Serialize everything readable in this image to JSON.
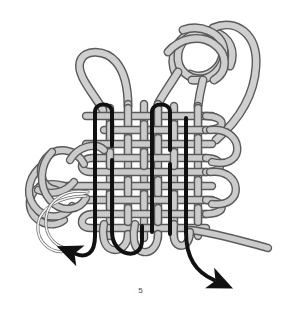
{
  "figure": {
    "caption": "5",
    "type": "knot-weaving-diagram"
  },
  "colors": {
    "background": "#ffffff",
    "cord_gray_fill": "#c9c9c9",
    "cord_gray_fill_light": "#d8d8d8",
    "cord_gray_outline": "#5a5a5a",
    "cord_black": "#111111",
    "caption_text": "#4a4a4a"
  },
  "cords": [
    {
      "name": "gray-cord",
      "color": "#c9c9c9",
      "outline": "#5a5a5a",
      "width": 7,
      "description": "light gray working cord forming top-right knot, side loops and woven grid"
    },
    {
      "name": "black-cord",
      "color": "#111111",
      "width": 4,
      "description": "black cord forming vertical bights through the woven grid, ending in arrows"
    }
  ],
  "markers": [
    {
      "name": "arrow-bottom-left",
      "label": "direction arrow",
      "direction": "left",
      "color": "#111111",
      "x": 74,
      "y": 252
    },
    {
      "name": "arrow-bottom-right",
      "label": "direction arrow",
      "direction": "down-right",
      "color": "#111111",
      "x": 216,
      "y": 279
    }
  ],
  "weave": {
    "columns": 9,
    "rows": 8,
    "grid_left": 88,
    "grid_right": 208,
    "grid_top": 104,
    "grid_bottom": 232
  }
}
